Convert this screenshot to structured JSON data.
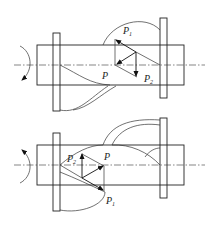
{
  "figures": [
    {
      "id": "top",
      "rotation": "clockwise-down",
      "labels": {
        "p": "P",
        "p1": "P",
        "p1_sub": "1",
        "p2": "P",
        "p2_sub": "2"
      }
    },
    {
      "id": "bottom",
      "rotation": "counterclockwise-up",
      "labels": {
        "p": "P",
        "p1": "P",
        "p1_sub": "1",
        "p2": "P",
        "p2_sub": "2"
      }
    }
  ]
}
